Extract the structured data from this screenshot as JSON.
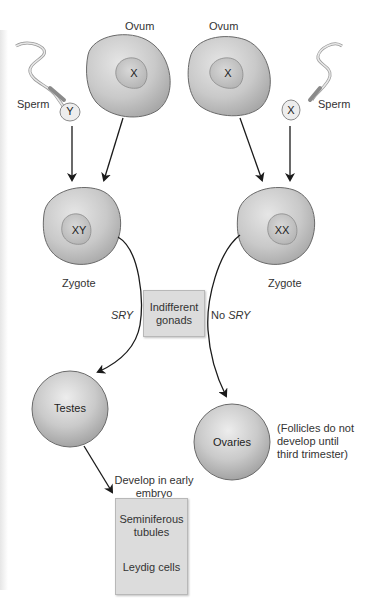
{
  "gametes": {
    "left_sperm": {
      "label": "Sperm",
      "chromosome": "Y"
    },
    "left_ovum": {
      "label": "Ovum",
      "chromosome": "X"
    },
    "right_ovum": {
      "label": "Ovum",
      "chromosome": "X"
    },
    "right_sperm": {
      "label": "Sperm",
      "chromosome": "X"
    }
  },
  "zygotes": {
    "male": {
      "label": "Zygote",
      "karyotype": "XY"
    },
    "female": {
      "label": "Zygote",
      "karyotype": "XX"
    }
  },
  "center_box": {
    "line1": "Indifferent",
    "line2": "gonads"
  },
  "pathways": {
    "male": {
      "gene": "SRY"
    },
    "female": {
      "prefix": "No ",
      "gene": "SRY"
    }
  },
  "gonads": {
    "testes": {
      "label": "Testes"
    },
    "ovaries": {
      "label": "Ovaries",
      "note_lines": [
        "(Follicles do not",
        "develop until",
        "third trimester)"
      ]
    }
  },
  "testes_development": {
    "caption_lines": [
      "Develop in early",
      "embryo"
    ],
    "box_items": [
      {
        "line1": "Seminiferous",
        "line2": "tubules"
      },
      {
        "line1": "Leydig cells"
      }
    ]
  },
  "colors": {
    "cell_fill": "#c4c4c4",
    "cell_edge": "#6a6a6a",
    "box_fill": "#dcdcdc",
    "arrow": "#1a1a1a",
    "background": "#ffffff"
  }
}
